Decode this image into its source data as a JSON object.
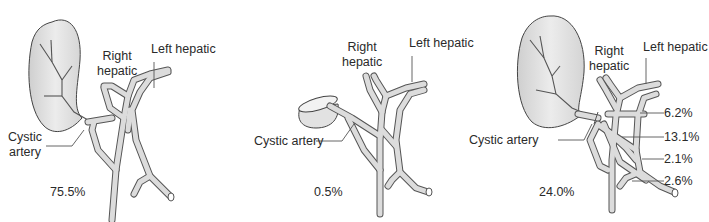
{
  "figure": {
    "colors": {
      "vessel_fill": "#dcdcdc",
      "vessel_stroke": "#555555",
      "gallbladder_fill": "#e4e4e4",
      "text": "#2a2a2a",
      "leader_line": "#555555"
    },
    "panels": [
      {
        "id": "panel-1",
        "labels": {
          "right_hepatic_line1": "Right",
          "right_hepatic_line2": "hepatic",
          "left_hepatic": "Left hepatic",
          "cystic_line1": "Cystic",
          "cystic_line2": "artery"
        },
        "percentage": "75.5%"
      },
      {
        "id": "panel-2",
        "labels": {
          "right_hepatic_line1": "Right",
          "right_hepatic_line2": "hepatic",
          "left_hepatic": "Left hepatic",
          "cystic": "Cystic artery"
        },
        "percentage": "0.5%"
      },
      {
        "id": "panel-3",
        "labels": {
          "right_hepatic_line1": "Right",
          "right_hepatic_line2": "hepatic",
          "left_hepatic": "Left hepatic",
          "cystic": "Cystic artery"
        },
        "percentage": "24.0%",
        "sub_variants": [
          "6.2%",
          "13.1%",
          "2.1%",
          "2.6%"
        ]
      }
    ]
  }
}
